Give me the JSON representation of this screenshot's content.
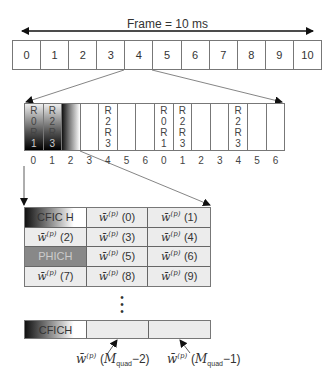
{
  "frame": {
    "title": "Frame = 10 ms",
    "subframes": [
      "0",
      "1",
      "2",
      "3",
      "4",
      "5",
      "6",
      "7",
      "8",
      "9",
      "10"
    ]
  },
  "subframe_detail": {
    "cells": [
      {
        "text": [
          "R",
          "0",
          "R",
          "1"
        ],
        "style": "dark"
      },
      {
        "text": [
          "R",
          "2",
          "R",
          "3"
        ],
        "style": "dark"
      },
      {
        "text": [],
        "style": "dark2"
      },
      {
        "text": [],
        "style": "plain"
      },
      {
        "text": [
          "R",
          "2",
          "R",
          "3"
        ],
        "style": "plain"
      },
      {
        "text": [],
        "style": "plain"
      },
      {
        "text": [],
        "style": "plain"
      },
      {
        "text": [
          "R",
          "0",
          "R",
          "1"
        ],
        "style": "plain"
      },
      {
        "text": [
          "R",
          "2",
          "R",
          "3"
        ],
        "style": "plain"
      },
      {
        "text": [],
        "style": "plain"
      },
      {
        "text": [],
        "style": "plain"
      },
      {
        "text": [
          "R",
          "2",
          "R",
          "3"
        ],
        "style": "plain"
      },
      {
        "text": [],
        "style": "plain"
      },
      {
        "text": [],
        "style": "plain"
      }
    ],
    "symbol_indices": [
      "0",
      "1",
      "2",
      "3",
      "4",
      "5",
      "6",
      "0",
      "1",
      "2",
      "3",
      "4",
      "5",
      "6"
    ]
  },
  "resource_grid": {
    "cells": [
      {
        "type": "cfich",
        "label": "CFIC H"
      },
      {
        "type": "w",
        "index": "0"
      },
      {
        "type": "w",
        "index": "1"
      },
      {
        "type": "w",
        "index": "2"
      },
      {
        "type": "w",
        "index": "3"
      },
      {
        "type": "w",
        "index": "4"
      },
      {
        "type": "phich",
        "label": "PHICH"
      },
      {
        "type": "w",
        "index": "5"
      },
      {
        "type": "w",
        "index": "6"
      },
      {
        "type": "w",
        "index": "7"
      },
      {
        "type": "w",
        "index": "8"
      },
      {
        "type": "w",
        "index": "9"
      }
    ],
    "w_symbol": "w̄",
    "w_superscript": "(p)",
    "ellipsis": ":"
  },
  "bottom_row": {
    "cfich_label": "CFICH",
    "labels": [
      {
        "w": "w̄",
        "sup": "(p)",
        "open": "(",
        "M": "M",
        "sub": "quad",
        "minus": "−2",
        "close": ")"
      },
      {
        "w": "w̄",
        "sup": "(p)",
        "open": "(",
        "M": "M",
        "sub": "quad",
        "minus": "−1",
        "close": ")"
      }
    ]
  }
}
